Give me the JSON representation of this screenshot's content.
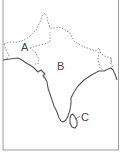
{
  "map": {
    "title": "",
    "labels": [
      {
        "id": "A",
        "text": "A",
        "x": 21,
        "y": 42
      },
      {
        "id": "B",
        "text": "B",
        "x": 57,
        "y": 61
      },
      {
        "id": "C",
        "text": "C",
        "x": 81,
        "y": 112
      }
    ],
    "colors": {
      "border": "#9a9a9a",
      "coastline": "#555555",
      "dashed_boundary": "#8a8a8a",
      "background": "#ffffff"
    }
  }
}
